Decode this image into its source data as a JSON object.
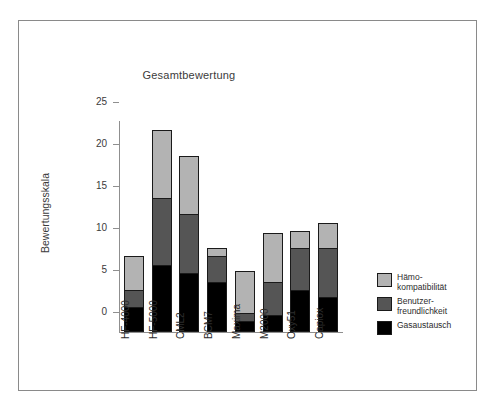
{
  "figure": {
    "title": "Gesamtbewertung",
    "y_axis_label": "Bewertungsskala"
  },
  "colors": {
    "haemokompatibilitaet": "#b3b3b3",
    "benutzerfreundlichkeit": "#555555",
    "gasaustausch": "#000000",
    "axis": "#8f8f8f",
    "frame": "#8a8a8a",
    "text": "#2c2c2c",
    "background": "#ffffff"
  },
  "legend": {
    "position": "right",
    "entries": [
      {
        "label": "Hämo-\nkompatibilität",
        "color": "#b3b3b3",
        "key": "haemokompatibilitaet"
      },
      {
        "label": "Benutzer-\nfreundlichkeit",
        "color": "#555555",
        "key": "benutzerfreundlichkeit"
      },
      {
        "label": "Gasaustausch",
        "color": "#000000",
        "key": "gasaustausch"
      }
    ]
  },
  "y_ticks": [
    "0",
    "5",
    "10",
    "15",
    "20",
    "25"
  ],
  "chart_data": {
    "type": "bar",
    "stacked": true,
    "title": "Gesamtbewertung",
    "xlabel": "",
    "ylabel": "Bewertungsskala",
    "ylim": [
      0,
      25
    ],
    "ytick_step": 5,
    "grid": false,
    "legend_position": "right",
    "categories": [
      "HF-4000",
      "HF-5000",
      "CML2",
      "BCM7",
      "Maxima",
      "M2000",
      "Oxy51",
      "Capiox"
    ],
    "series": [
      {
        "name": "Gasaustausch",
        "color": "#000000",
        "values": [
          3,
          8,
          7,
          6,
          1.3,
          2,
          5,
          4.2
        ]
      },
      {
        "name": "Benutzerfreundlichkeit",
        "color": "#555555",
        "values": [
          2,
          8,
          7,
          3,
          1,
          4,
          5,
          5.8
        ]
      },
      {
        "name": "Hämokompatibilität",
        "color": "#b3b3b3",
        "values": [
          4,
          8,
          7,
          1,
          5,
          5.8,
          2,
          3
        ]
      }
    ],
    "totals": [
      9,
      24,
      21,
      10,
      7.2,
      11.8,
      12,
      13
    ]
  }
}
